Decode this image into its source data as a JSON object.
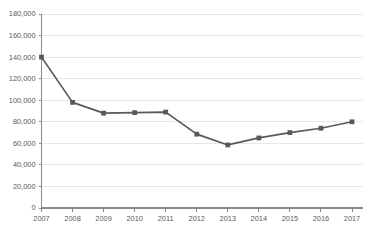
{
  "chart_data": {
    "type": "line",
    "title": "",
    "subtitle": "",
    "xlabel": "",
    "ylabel": "",
    "categories": [
      "2007",
      "2008",
      "2009",
      "2010",
      "2011",
      "2012",
      "2013",
      "2014",
      "2015",
      "2016",
      "2017"
    ],
    "values": [
      140000,
      98000,
      88000,
      88500,
      89000,
      68500,
      58500,
      65000,
      70000,
      74000,
      80000
    ],
    "series": [
      {
        "name": "",
        "values": [
          140000,
          98000,
          88000,
          88500,
          89000,
          68500,
          58500,
          65000,
          70000,
          74000,
          80000
        ],
        "color": "#595959",
        "marker": "square"
      }
    ],
    "ylim": [
      0,
      180000
    ],
    "ytick_values": [
      0,
      20000,
      40000,
      60000,
      80000,
      100000,
      120000,
      140000,
      160000,
      180000
    ],
    "ytick_labels": [
      "0",
      "20,000",
      "40,000",
      "60,000",
      "80,000",
      "100,000",
      "120,000",
      "140,000",
      "160,000",
      "180,000"
    ],
    "xtick_labels": [
      "2007",
      "2008",
      "2009",
      "2010",
      "2011",
      "2012",
      "2013",
      "2014",
      "2015",
      "2016",
      "2017"
    ],
    "grid": {
      "horizontal": true,
      "vertical": false,
      "color": "#e8e8e8"
    },
    "legend": {
      "visible": false,
      "position": "none",
      "entries": []
    },
    "colors": {
      "line": "#595959",
      "marker": "#595959",
      "gridline": "#e8e8e8",
      "axis": "#8a8a8a",
      "tick_text": "#5a5a5a",
      "background": "#ffffff"
    }
  },
  "footer": {
    "attribution": ""
  }
}
